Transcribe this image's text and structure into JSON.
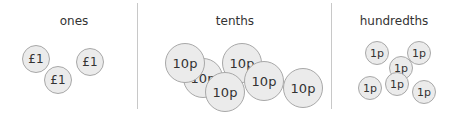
{
  "columns": [
    {
      "title": "ones",
      "title_x": 74,
      "coin_radius": 14,
      "font_size": 12,
      "coins": [
        {
          "label": "£1",
          "x": 36,
          "y": 59
        },
        {
          "label": "£1",
          "x": 90,
          "y": 62
        },
        {
          "label": "£1",
          "x": 58,
          "y": 80
        }
      ]
    },
    {
      "title": "tenths",
      "title_x": 235,
      "coin_radius": 20,
      "font_size": 13,
      "coins": [
        {
          "label": "10p",
          "x": 203,
          "y": 78
        },
        {
          "label": "10p",
          "x": 303,
          "y": 88
        },
        {
          "label": "10p",
          "x": 185,
          "y": 63
        },
        {
          "label": "10p",
          "x": 242,
          "y": 63
        },
        {
          "label": "10p",
          "x": 225,
          "y": 92
        },
        {
          "label": "10p",
          "x": 264,
          "y": 81
        }
      ]
    },
    {
      "title": "hundredths",
      "title_x": 394,
      "coin_radius": 12,
      "font_size": 11,
      "coins": [
        {
          "label": "1p",
          "x": 377,
          "y": 53
        },
        {
          "label": "1p",
          "x": 419,
          "y": 53
        },
        {
          "label": "1p",
          "x": 401,
          "y": 68
        },
        {
          "label": "1p",
          "x": 370,
          "y": 88
        },
        {
          "label": "1p",
          "x": 397,
          "y": 84
        },
        {
          "label": "1p",
          "x": 424,
          "y": 92
        }
      ]
    }
  ],
  "dividers": [
    137,
    331
  ]
}
